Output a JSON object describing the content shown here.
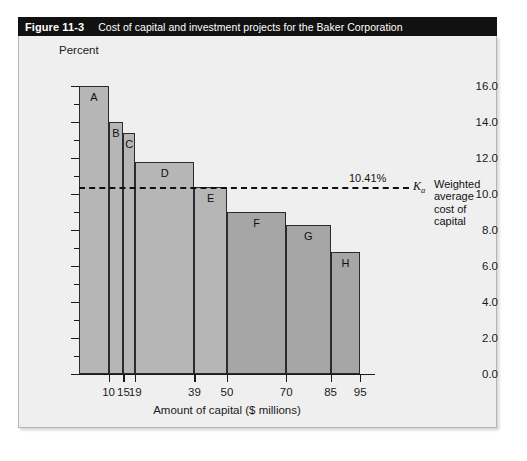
{
  "figure": {
    "number": "Figure 11-3",
    "caption": "Cost of capital and investment projects for the Baker Corporation"
  },
  "chart_data": {
    "type": "bar",
    "title": "Cost of capital and investment projects for the Baker Corporation",
    "xlabel": "Amount of capital ($ millions)",
    "ylabel": "Percent",
    "ylim": [
      0.0,
      16.0
    ],
    "xlim": [
      0,
      100
    ],
    "grid": false,
    "legend": null,
    "y_major_ticks": [
      "0.0",
      "2.0",
      "4.0",
      "6.0",
      "8.0",
      "10.0",
      "12.0",
      "14.0",
      "16.0"
    ],
    "y_major_values": [
      0.0,
      2.0,
      4.0,
      6.0,
      8.0,
      10.0,
      12.0,
      14.0,
      16.0
    ],
    "y_minor_values": [
      1.0,
      3.0,
      5.0,
      7.0,
      9.0,
      11.0,
      13.0,
      15.0
    ],
    "x_tick_labels": [
      "10",
      "15",
      "19",
      "39",
      "50",
      "70",
      "85",
      "95"
    ],
    "x_tick_values": [
      10,
      15,
      19,
      39,
      50,
      70,
      85,
      95
    ],
    "categories": [
      "A",
      "B",
      "C",
      "D",
      "E",
      "F",
      "G",
      "H"
    ],
    "values": [
      16.0,
      14.0,
      13.4,
      11.8,
      10.4,
      9.0,
      8.3,
      6.8
    ],
    "bars": [
      {
        "label": "A",
        "value": 16.0,
        "x_start": 0,
        "x_end": 10,
        "color": "#b6b6b6"
      },
      {
        "label": "B",
        "value": 14.0,
        "x_start": 10,
        "x_end": 15,
        "color": "#b6b6b6"
      },
      {
        "label": "C",
        "value": 13.4,
        "x_start": 15,
        "x_end": 19,
        "color": "#b6b6b6"
      },
      {
        "label": "D",
        "value": 11.8,
        "x_start": 19,
        "x_end": 39,
        "color": "#b6b6b6"
      },
      {
        "label": "E",
        "value": 10.4,
        "x_start": 39,
        "x_end": 50,
        "color": "#b6b6b6"
      },
      {
        "label": "F",
        "value": 9.0,
        "x_start": 50,
        "x_end": 70,
        "color": "#a6a6a6"
      },
      {
        "label": "G",
        "value": 8.3,
        "x_start": 70,
        "x_end": 85,
        "color": "#a6a6a6"
      },
      {
        "label": "H",
        "value": 6.8,
        "x_start": 85,
        "x_end": 95,
        "color": "#a6a6a6"
      }
    ],
    "annotations": [
      {
        "name": "wacc-line",
        "value": 10.41,
        "value_label": "10.41%",
        "symbol": "K",
        "symbol_sub": "a",
        "description": "Weighted\naverage\ncost of\ncapital",
        "style": "dashed-horizontal"
      }
    ],
    "colors": {
      "panel_background": "#efefef",
      "title_bar": "#111111",
      "bar_light": "#b6b6b6",
      "bar_dark": "#a6a6a6",
      "axis": "#1a1a1a"
    }
  }
}
